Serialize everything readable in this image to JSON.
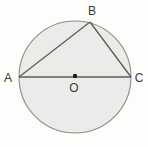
{
  "figure": {
    "type": "geometry-diagram",
    "labels": {
      "a": "A",
      "b": "B",
      "c": "C",
      "center": "O"
    },
    "colors": {
      "background": "#fdfdfc",
      "circle_fill": "#ebecea",
      "circle_stroke": "#8a8a86",
      "line_stroke": "#5c5c58",
      "center_dot": "#1c1c1a",
      "label_color": "#3a3a36"
    }
  }
}
